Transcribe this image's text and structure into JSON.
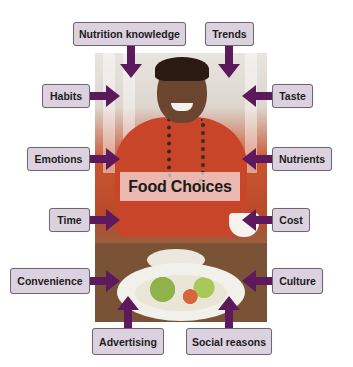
{
  "diagram": {
    "center_label": "Food Choices",
    "factors": [
      {
        "id": "nutrition-knowledge",
        "label": "Nutrition knowledge",
        "position": "top",
        "arrow": "down"
      },
      {
        "id": "trends",
        "label": "Trends",
        "position": "top",
        "arrow": "down"
      },
      {
        "id": "habits",
        "label": "Habits",
        "position": "left",
        "arrow": "right"
      },
      {
        "id": "taste",
        "label": "Taste",
        "position": "right",
        "arrow": "left"
      },
      {
        "id": "emotions",
        "label": "Emotions",
        "position": "left",
        "arrow": "right"
      },
      {
        "id": "nutrients",
        "label": "Nutrients",
        "position": "right",
        "arrow": "left"
      },
      {
        "id": "time",
        "label": "Time",
        "position": "left",
        "arrow": "right"
      },
      {
        "id": "cost",
        "label": "Cost",
        "position": "right",
        "arrow": "left"
      },
      {
        "id": "convenience",
        "label": "Convenience",
        "position": "left",
        "arrow": "right"
      },
      {
        "id": "culture",
        "label": "Culture",
        "position": "right",
        "arrow": "left"
      },
      {
        "id": "advertising",
        "label": "Advertising",
        "position": "bottom",
        "arrow": "up"
      },
      {
        "id": "social-reasons",
        "label": "Social reasons",
        "position": "bottom",
        "arrow": "up"
      }
    ],
    "colors": {
      "box_fill": "#dcd1df",
      "box_border": "#6e6670",
      "arrow": "#5c1a5c",
      "text": "#1c1c1c"
    },
    "photo_description": "Smiling woman in red sweater seated at table with salad"
  }
}
